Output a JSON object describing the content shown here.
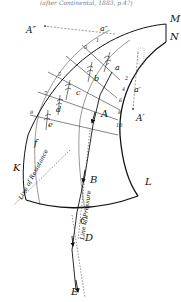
{
  "caption_top": "(after Continental, 1883, p.4?)",
  "points": {
    "M": "M",
    "N": "N",
    "K": "K",
    "L": "L",
    "A": "A",
    "B": "B",
    "C": "C",
    "D": "D",
    "E": "E",
    "A_dbl": "A″",
    "A_prime": "A′",
    "a": "a",
    "a_dbl": "a″",
    "a_prime": "a′",
    "b": "b",
    "c": "c",
    "d": "d",
    "e": "e",
    "f": "f"
  },
  "left_numbers": [
    "1",
    "3",
    "5",
    "7",
    "9"
  ],
  "right_numbers": [
    "2",
    "4",
    "6",
    "8",
    "10"
  ],
  "line_labels": {
    "resistance": "Line of Resistance",
    "pressure": "Line of Pressure"
  }
}
